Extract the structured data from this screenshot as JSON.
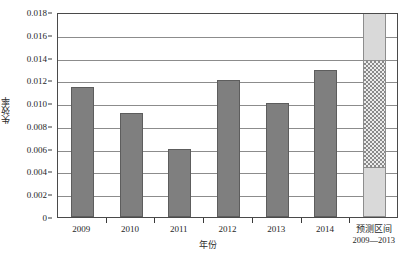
{
  "chart_data": {
    "type": "bar",
    "title": "",
    "xlabel": "年份",
    "ylabel": "失效率",
    "categories": [
      "2009",
      "2010",
      "2011",
      "2012",
      "2013",
      "2014",
      "预测区间"
    ],
    "category_sublabels": [
      "",
      "",
      "",
      "",
      "",
      "",
      "2009—2013"
    ],
    "values": [
      0.0114,
      0.0091,
      0.006,
      0.012,
      0.01,
      0.0129,
      null
    ],
    "ylim": [
      0,
      0.018
    ],
    "ytick_values": [
      0,
      0.002,
      0.004,
      0.006,
      0.008,
      0.01,
      0.012,
      0.014,
      0.016,
      0.018
    ],
    "ytick_labels": [
      "0",
      "0.002",
      "0.004",
      "0.006",
      "0.008",
      "0.010",
      "0.012",
      "0.014",
      "0.016",
      "0.018"
    ],
    "grid": true,
    "grid_axis": "y",
    "legend": "none",
    "bar_color": "#7f7f7f",
    "bar_edge_color": "#5d5d5d",
    "prediction_interval": {
      "label": "预测区间",
      "sublabel": "2009—2013",
      "lower": 0.0044,
      "upper": 0.0139,
      "span_top": 0.018,
      "span_bottom": 0,
      "band_fill": "hatched-checker",
      "outer_fill": "#d9d9d9",
      "band_color": "#8a8a8a"
    },
    "axis_color": "#4a4a4a",
    "gridline_color": "#8c8c8c",
    "background": "#ffffff"
  }
}
